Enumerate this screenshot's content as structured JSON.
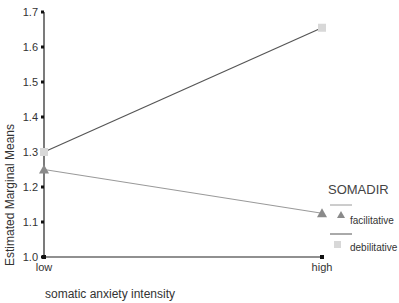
{
  "chart_data": {
    "type": "line",
    "title": "",
    "xlabel": "somatic anxiety intensity",
    "ylabel": "Estimated Marginal Means",
    "categories": [
      "low",
      "high"
    ],
    "ylim": [
      1.0,
      1.7
    ],
    "yticks": [
      "1.0",
      "1.1",
      "1.2",
      "1.3",
      "1.4",
      "1.5",
      "1.6",
      "1.7"
    ],
    "grid": false,
    "legend": {
      "title": "SOMADIR",
      "position": "right",
      "entries": [
        "facilitative",
        "debilitative"
      ]
    },
    "series": [
      {
        "name": "facilitative",
        "values": [
          1.25,
          1.125
        ],
        "marker": "triangle",
        "line_color": "#9a9a9a",
        "marker_color": "#8a8a8a"
      },
      {
        "name": "debilitative",
        "values": [
          1.3,
          1.655
        ],
        "marker": "square",
        "line_color": "#555555",
        "marker_color": "#d8d8d8"
      }
    ]
  }
}
